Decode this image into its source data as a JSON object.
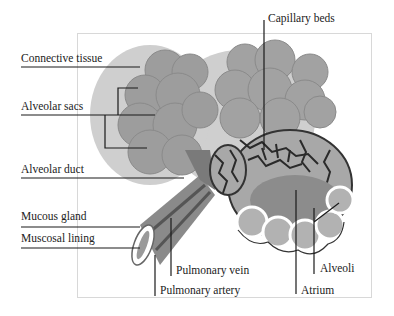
{
  "diagram": {
    "labels": {
      "connective_tissue": "Connective tissue",
      "alveolar_sacs": "Alveolar sacs",
      "alveolar_duct": "Alveolar duct",
      "mucous_gland": "Mucous gland",
      "muscosal_lining": "Muscosal lining",
      "capillary_beds": "Capillary beds",
      "pulmonary_vein": "Pulmonary vein",
      "pulmonary_artery": "Pulmonary artery",
      "alveoli": "Alveoli",
      "atrium": "Atrium"
    },
    "colors": {
      "tissue": "#9a9a9a",
      "tissue_dark": "#6e6e6e",
      "capillary": "#2a2a2a",
      "leader_line": "#1a1a1a",
      "frame": "#d8d8d8"
    }
  }
}
